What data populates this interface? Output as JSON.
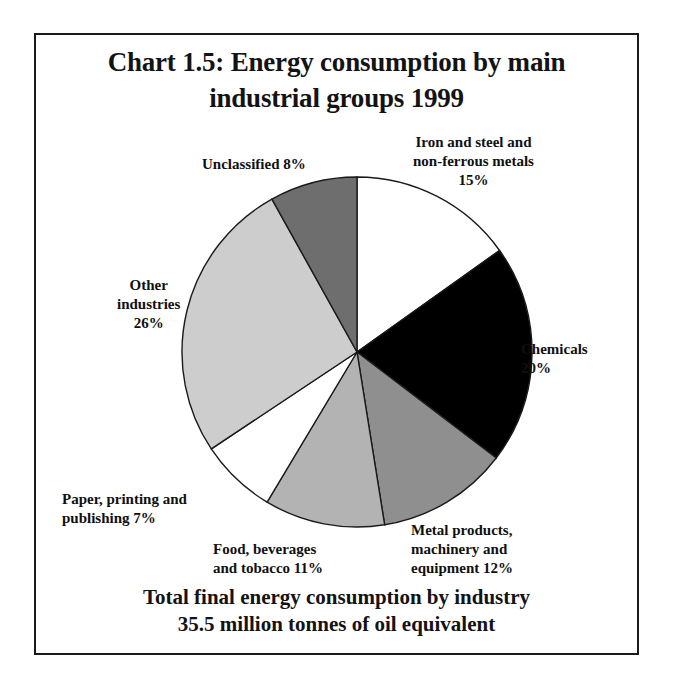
{
  "title": {
    "line1": "Chart 1.5: Energy consumption by main",
    "line2": "industrial groups 1999"
  },
  "footer": {
    "line1": "Total final energy consumption by industry",
    "line2": "35.5 million tonnes of oil equivalent"
  },
  "labels": {
    "iron": {
      "line1": "Iron and steel and",
      "line2": "non-ferrous metals",
      "line3": "15%"
    },
    "chemicals": {
      "line1": "Chemicals",
      "line2": "20%"
    },
    "metal": {
      "line1": "Metal products,",
      "line2": "machinery and",
      "line3": "equipment  12%"
    },
    "food": {
      "line1": "Food, beverages",
      "line2": "and tobacco  11%"
    },
    "paper": {
      "line1": "Paper, printing and",
      "line2": "publishing    7%"
    },
    "other": {
      "line1": "Other",
      "line2": "industries",
      "line3": "26%"
    },
    "unclassified": {
      "line1": "Unclassified  8%"
    }
  },
  "chart_data": {
    "type": "pie",
    "title": "Chart 1.5: Energy consumption by main industrial groups 1999",
    "subtitle": "Total final energy consumption by industry 35.5 million tonnes of oil equivalent",
    "unit": "percent",
    "total_label": "35.5 million tonnes of oil equivalent",
    "start_angle_deg": 0,
    "direction": "clockwise",
    "legend": "none-inline-callouts",
    "categories": [
      "Iron and steel and non-ferrous metals",
      "Chemicals",
      "Metal products, machinery and equipment",
      "Food, beverages and tobacco",
      "Paper, printing and publishing",
      "Other industries",
      "Unclassified"
    ],
    "values": [
      15,
      20,
      12,
      11,
      7,
      26,
      8
    ],
    "colors": [
      "#ffffff",
      "#000000",
      "#8f8f8f",
      "#b3b3b3",
      "#ffffff",
      "#cdcdcd",
      "#6e6e6e"
    ],
    "slices": [
      {
        "name": "Iron and steel and non-ferrous metals",
        "value": 15,
        "label": "15%",
        "color": "#ffffff"
      },
      {
        "name": "Chemicals",
        "value": 20,
        "label": "20%",
        "color": "#000000"
      },
      {
        "name": "Metal products, machinery and equipment",
        "value": 12,
        "label": "12%",
        "color": "#8f8f8f"
      },
      {
        "name": "Food, beverages and tobacco",
        "value": 11,
        "label": "11%",
        "color": "#b3b3b3"
      },
      {
        "name": "Paper, printing and publishing",
        "value": 7,
        "label": "7%",
        "color": "#ffffff"
      },
      {
        "name": "Other industries",
        "value": 26,
        "label": "26%",
        "color": "#cdcdcd"
      },
      {
        "name": "Unclassified",
        "value": 8,
        "label": "8%",
        "color": "#6e6e6e"
      }
    ]
  },
  "geometry": {
    "cx": 357,
    "cy": 352,
    "r": 175
  }
}
